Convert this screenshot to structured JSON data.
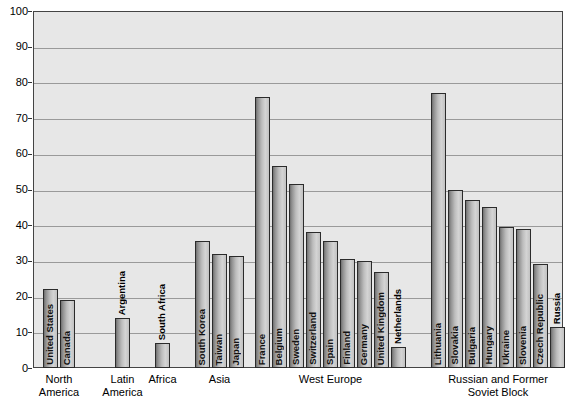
{
  "chart_data": {
    "type": "bar",
    "title": "",
    "xlabel": "",
    "ylabel": "",
    "ylim": [
      0,
      100
    ],
    "ytick_labels": [
      "0",
      "10",
      "20",
      "30",
      "40",
      "50",
      "60",
      "70",
      "80",
      "90",
      "100"
    ],
    "ytick_values": [
      0,
      10,
      20,
      30,
      40,
      50,
      60,
      70,
      80,
      90,
      100
    ],
    "grid": true,
    "legend": "none",
    "categories": [
      "United States",
      "Canada",
      "Argentina",
      "South Africa",
      "South Korea",
      "Taiwan",
      "Japan",
      "France",
      "Belgium",
      "Sweden",
      "Switzerland",
      "Spain",
      "Finland",
      "Germany",
      "United Kingdom",
      "Netherlands",
      "Lithuania",
      "Slovakia",
      "Bulgaria",
      "Hungary",
      "Ukraine",
      "Slovenia",
      "Czech Republic",
      "Russia"
    ],
    "values": [
      22,
      19,
      14,
      7,
      35.5,
      32,
      31.5,
      76,
      56.5,
      51.5,
      38,
      35.5,
      30.5,
      30,
      27,
      6,
      77,
      50,
      47,
      45,
      39.5,
      39,
      29,
      11.5
    ],
    "groups": [
      {
        "label": "North\nAmerica",
        "bars": [
          "United States",
          "Canada"
        ]
      },
      {
        "label": "Latin\nAmerica",
        "bars": [
          "Argentina"
        ]
      },
      {
        "label": "Africa",
        "bars": [
          "South Africa"
        ]
      },
      {
        "label": "Asia",
        "bars": [
          "South Korea",
          "Taiwan",
          "Japan"
        ]
      },
      {
        "label": "West Europe",
        "bars": [
          "France",
          "Belgium",
          "Sweden",
          "Switzerland",
          "Spain",
          "Finland",
          "Germany",
          "United Kingdom",
          "Netherlands"
        ]
      },
      {
        "label": "Russian and Former\nSoviet Block",
        "bars": [
          "Lithuania",
          "Slovakia",
          "Bulgaria",
          "Hungary",
          "Ukraine",
          "Slovenia",
          "Czech Republic",
          "Russia"
        ]
      }
    ],
    "group_labels": [
      "North America",
      "Latin America",
      "Africa",
      "Asia",
      "West Europe",
      "Russian and Former Soviet Block"
    ],
    "group_label_lines": [
      [
        "North",
        "America"
      ],
      [
        "Latin",
        "America"
      ],
      [
        "Africa"
      ],
      [
        "Asia"
      ],
      [
        "West Europe"
      ],
      [
        "Russian and Former",
        "Soviet Block"
      ]
    ],
    "colors": {
      "plot_background": "#e7e7e7",
      "bar_fill_light": "#d4d4d4",
      "bar_fill_dark": "#6f6f6f",
      "bar_border": "#2b2b2b",
      "gridline": "#9a9a9a",
      "axis": "#444444",
      "text": "#000000",
      "page_background": "#ffffff"
    }
  }
}
